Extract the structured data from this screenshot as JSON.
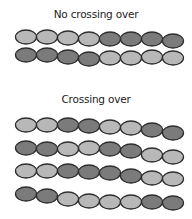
{
  "colors": {
    "light": "#b8b8b8",
    "dark": "#7b7b7b",
    "outline": "#2e2e2e"
  },
  "sections": [
    {
      "title": "No crossing over",
      "chains": [
        {
          "y": [
            37,
            37,
            38,
            39,
            39,
            39,
            39,
            41
          ],
          "beads": [
            "light",
            "light",
            "light",
            "light",
            "dark",
            "dark",
            "dark",
            "dark"
          ]
        },
        {
          "y": [
            55,
            55,
            57,
            59,
            58,
            58,
            57,
            58
          ],
          "beads": [
            "dark",
            "dark",
            "dark",
            "dark",
            "light",
            "light",
            "light",
            "light"
          ]
        }
      ]
    },
    {
      "title": "Crossing over",
      "chains": [
        {
          "y": [
            125,
            125,
            125,
            126,
            127,
            128,
            130,
            133
          ],
          "beads": [
            "light",
            "light",
            "dark",
            "dark",
            "light",
            "light",
            "dark",
            "dark"
          ]
        },
        {
          "y": [
            148,
            149,
            149,
            148,
            149,
            151,
            155,
            157
          ],
          "beads": [
            "dark",
            "dark",
            "light",
            "light",
            "dark",
            "dark",
            "light",
            "light"
          ]
        },
        {
          "y": [
            171,
            171,
            171,
            172,
            173,
            176,
            178,
            179
          ],
          "beads": [
            "light",
            "light",
            "dark",
            "dark",
            "dark",
            "dark",
            "light",
            "light"
          ]
        },
        {
          "y": [
            194,
            196,
            199,
            201,
            202,
            202,
            202,
            203
          ],
          "beads": [
            "dark",
            "dark",
            "light",
            "light",
            "light",
            "light",
            "dark",
            "dark"
          ]
        }
      ]
    }
  ]
}
